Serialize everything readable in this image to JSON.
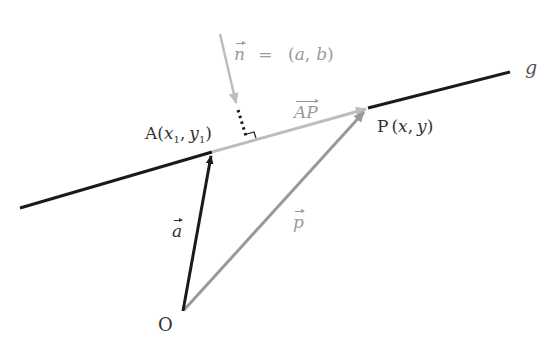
{
  "diagram": {
    "title": "",
    "colors": {
      "line_g": "#1a1a1a",
      "vector_a": "#1a1a1a",
      "vector_p": "#999999",
      "vector_AP": "#bdbdbd",
      "normal": "#bdbdbd",
      "text_dark": "#333333",
      "text_light": "#9a9a9a"
    },
    "labels": {
      "line_name": "g",
      "point_A": "A",
      "point_A_coords_open": "(",
      "point_A_x": "x",
      "point_A_x_sub": "1",
      "point_A_sep": ",",
      "point_A_y": "y",
      "point_A_y_sub": "1",
      "point_A_close": ")",
      "point_P": "P",
      "point_P_coords": "(x, y)",
      "point_P_open": "(",
      "point_P_x": "x",
      "point_P_sep": ",",
      "point_P_y": "y",
      "point_P_close": ")",
      "origin": "O",
      "vector_a": "a",
      "vector_p": "p",
      "vector_AP": "AP",
      "normal_vector": "n",
      "normal_eq": "=",
      "normal_components_open": "(",
      "normal_a": "a",
      "normal_sep": ",",
      "normal_b": "b",
      "normal_components_close": ")"
    },
    "points": {
      "O": [
        183,
        311
      ],
      "A": [
        212,
        152
      ],
      "P": [
        368,
        108
      ],
      "g_start": [
        20,
        208
      ],
      "g_end": [
        510,
        72
      ]
    }
  }
}
